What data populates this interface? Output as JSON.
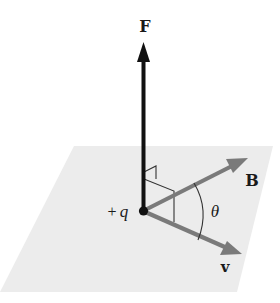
{
  "figure": {
    "type": "vector diagram"
  },
  "labels": {
    "force": "F",
    "field": "B",
    "velocity": "v",
    "charge_sign": "+",
    "charge": "q",
    "angle": "θ"
  },
  "colors": {
    "plane": "#ececec",
    "force_arrow": "#111111",
    "field_arrow": "#7a7a7a",
    "velocity_arrow": "#7a7a7a",
    "construction_lines": "#333333",
    "charge_dot": "#111111",
    "text": "#1a1a1a"
  },
  "geometry": {
    "origin": [
      143,
      211
    ],
    "force_tip": [
      145,
      42
    ],
    "field_tip": [
      247,
      159
    ],
    "velocity_tip": [
      241,
      254
    ],
    "plane_corners": [
      [
        74,
        146
      ],
      [
        273,
        146
      ],
      [
        237,
        292
      ],
      [
        0,
        292
      ]
    ]
  }
}
